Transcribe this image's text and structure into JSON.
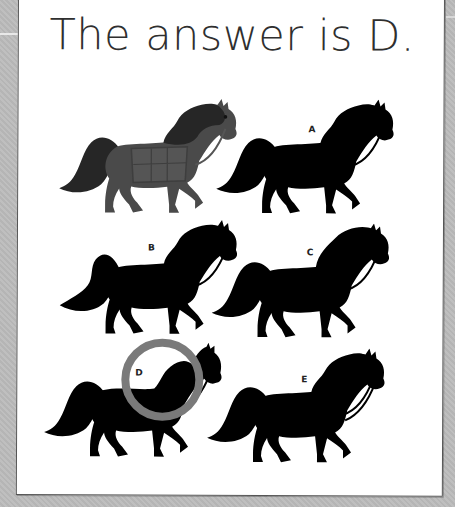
{
  "title": "The answer is D.",
  "reference_horse": {
    "description": "gray horse with saddle blanket",
    "colors": {
      "body": "#4a4a4a",
      "mane_tail": "#262626",
      "blanket": "#555555"
    }
  },
  "options": [
    {
      "label": "A",
      "style": "silhouette"
    },
    {
      "label": "B",
      "style": "silhouette"
    },
    {
      "label": "C",
      "style": "silhouette"
    },
    {
      "label": "D",
      "style": "silhouette",
      "correct": true
    },
    {
      "label": "E",
      "style": "silhouette"
    }
  ],
  "answer": {
    "label": "D",
    "highlight_color": "#7a7a7a"
  },
  "colors": {
    "background": "#bcbcbc",
    "card": "#ffffff",
    "silhouette": "#000000",
    "title_text": "#2f2f2f"
  }
}
